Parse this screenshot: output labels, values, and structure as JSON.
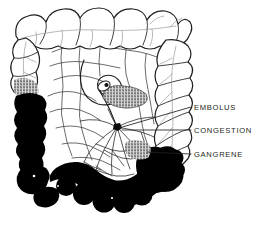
{
  "figure": {
    "kind": "medical-line-illustration",
    "background_color": "#ffffff",
    "ink_color": "#231f20",
    "necrosis_color": "#000000",
    "faint_ink_color": "#8b8b8b",
    "width": 265,
    "height": 225
  },
  "labels": [
    {
      "id": "embolus",
      "text": "EMBOLUS",
      "text_x": 194,
      "text_y": 110,
      "leader": {
        "x1": 191,
        "y1": 107,
        "x2": 119,
        "y2": 128
      }
    },
    {
      "id": "congestion",
      "text": "CONGESTION",
      "text_x": 194,
      "text_y": 133,
      "leader": {
        "x1": 191,
        "y1": 130,
        "x2": 122,
        "y2": 130
      }
    },
    {
      "id": "gangrene",
      "text": "GANGRENE",
      "text_x": 194,
      "text_y": 157,
      "leader": {
        "x1": 191,
        "y1": 154,
        "x2": 147,
        "y2": 152
      }
    }
  ],
  "regions": [
    {
      "id": "transverse-colon",
      "description": "Transverse colon, haustrated, unaffected"
    },
    {
      "id": "ascending-colon",
      "description": "Ascending colon, haustrated, unaffected"
    },
    {
      "id": "descending-colon",
      "description": "Descending colon, gangrenous (black)"
    },
    {
      "id": "sigmoid-colon",
      "description": "Sigmoid colon, gangrenous (black)"
    },
    {
      "id": "cecum",
      "description": "Cecum region, gangrenous (black)"
    },
    {
      "id": "mesentery",
      "description": "Mesenteric vascular fan with arcade vessels"
    },
    {
      "id": "congestion-patch",
      "description": "Stippled congestion near occluded vessel"
    },
    {
      "id": "embolus-point",
      "description": "Dark embolus occluding mesenteric artery"
    }
  ]
}
